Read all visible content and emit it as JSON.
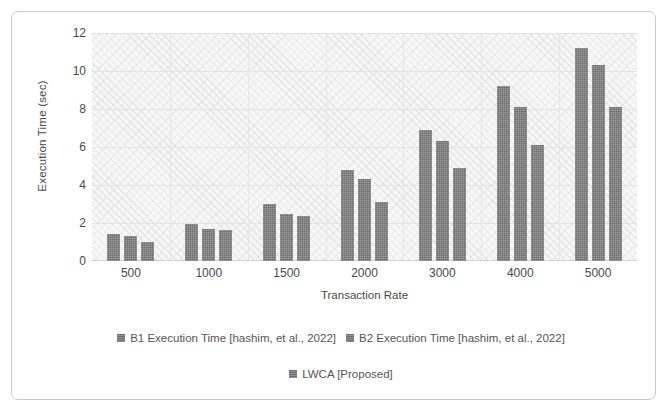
{
  "chart_data": {
    "type": "bar",
    "title": "",
    "xlabel": "Transaction Rate",
    "ylabel": "Execution Time (sec)",
    "categories": [
      "500",
      "1000",
      "1500",
      "2000",
      "3000",
      "4000",
      "5000"
    ],
    "series": [
      {
        "name": "B1 Execution Time [hashim, et al., 2022]",
        "color": "#6e6e6e",
        "values": [
          1.4,
          1.95,
          3.0,
          4.8,
          6.9,
          9.2,
          11.2
        ]
      },
      {
        "name": "B2 Execution Time [hashim, et al., 2022]",
        "color": "#6e6e6e",
        "values": [
          1.3,
          1.7,
          2.5,
          4.3,
          6.3,
          8.1,
          10.3
        ]
      },
      {
        "name": "LWCA [Proposed]",
        "color": "#6e6e6e",
        "values": [
          1.0,
          1.65,
          2.35,
          3.1,
          4.9,
          6.1,
          8.1
        ]
      }
    ],
    "ylim": [
      0,
      12
    ],
    "ytick_labels": [
      "12",
      "10",
      "8",
      "6",
      "4",
      "2",
      "0"
    ],
    "ytick_values": [
      12,
      10,
      8,
      6,
      4,
      2,
      0
    ],
    "grid": true,
    "legend_position": "bottom"
  },
  "colors": {
    "bar": "#6e6e6e",
    "plot_background": "#f7f7f7",
    "gridline": "#e2e2e2",
    "frame_border": "#c9c9c9",
    "text": "#4a4a4a"
  }
}
